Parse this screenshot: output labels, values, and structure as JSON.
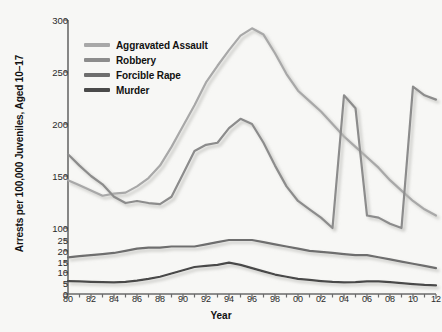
{
  "chart_data": {
    "type": "line",
    "title": "",
    "xlabel": "Year",
    "ylabel": "Arrests per 100,000 Juveniles, Aged 10–17",
    "grid": false,
    "legend_position": "top-left-inside",
    "broken_axis": true,
    "y_axis_lower": {
      "ticks": [
        0,
        5,
        10,
        15,
        20,
        25
      ],
      "range": [
        0,
        25
      ]
    },
    "y_axis_upper": {
      "ticks": [
        100,
        150,
        200,
        250,
        300
      ],
      "range": [
        100,
        300
      ]
    },
    "x": [
      1980,
      1981,
      1982,
      1983,
      1984,
      1985,
      1986,
      1987,
      1988,
      1989,
      1990,
      1991,
      1992,
      1993,
      1994,
      1995,
      1996,
      1997,
      1998,
      1999,
      2000,
      2001,
      2002,
      2003,
      2004,
      2005,
      2006,
      2007,
      2008,
      2009,
      2010,
      2011,
      2012
    ],
    "x_tick_labels": [
      "80",
      "82",
      "84",
      "86",
      "88",
      "90",
      "92",
      "94",
      "96",
      "98",
      "00",
      "02",
      "04",
      "06",
      "08",
      "10",
      "12"
    ],
    "series": [
      {
        "name": "Aggravated Assault",
        "color": "#a8a8a8",
        "values": [
          146,
          141,
          136,
          131,
          133,
          134,
          140,
          148,
          160,
          178,
          198,
          218,
          240,
          256,
          271,
          285,
          292,
          286,
          268,
          248,
          232,
          222,
          212,
          200,
          188,
          178,
          168,
          158,
          146,
          136,
          126,
          118,
          112
        ]
      },
      {
        "name": "Robbery",
        "color": "#8c8c8c",
        "values": [
          171,
          160,
          150,
          142,
          130,
          124,
          126,
          124,
          123,
          130,
          152,
          174,
          180,
          182,
          196,
          205,
          200,
          182,
          160,
          140,
          126,
          118,
          110,
          100,
          92,
          86,
          112,
          110,
          104,
          100,
          96,
          92,
          90
        ]
      },
      {
        "name": "Forcible Rape",
        "color": "#6e6e6e",
        "values": [
          17,
          17.5,
          18,
          18.5,
          19,
          20,
          21,
          21.5,
          21.5,
          22,
          22,
          22,
          23,
          24,
          25,
          25,
          25,
          24,
          23,
          22,
          21,
          20,
          19.5,
          19,
          18.5,
          18,
          18,
          17,
          16,
          15,
          14,
          13,
          12
        ]
      },
      {
        "name": "Murder",
        "color": "#4a4a4a",
        "values": [
          6,
          5.8,
          5.6,
          5.5,
          5.4,
          5.6,
          6.2,
          7,
          8,
          9.5,
          11,
          12.5,
          13,
          13.5,
          14.5,
          13.5,
          12,
          10.5,
          9,
          8,
          7,
          6.5,
          6,
          5.6,
          5.4,
          5.5,
          5.8,
          5.8,
          5.5,
          5,
          4.6,
          4.2,
          4
        ]
      }
    ]
  },
  "axes": {
    "y_tick_labels_upper": [
      "300",
      "250",
      "200",
      "150",
      "100"
    ],
    "y_tick_labels_lower": [
      "25",
      "20",
      "15",
      "10",
      "5",
      "0"
    ],
    "x_title": "Year",
    "y_title": "Arrests per 100,000 Juveniles, Aged 10–17"
  },
  "legend": {
    "items": [
      {
        "label": "Aggravated Assault",
        "color": "#a8a8a8"
      },
      {
        "label": "Robbery",
        "color": "#8c8c8c"
      },
      {
        "label": "Forcible Rape",
        "color": "#6e6e6e"
      },
      {
        "label": "Murder",
        "color": "#4a4a4a"
      }
    ]
  }
}
